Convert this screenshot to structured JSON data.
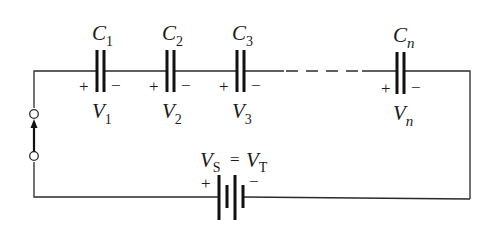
{
  "diagram": {
    "type": "series capacitor circuit",
    "capacitors": [
      {
        "id": "C1",
        "name": "C",
        "sub": "1",
        "volt": "V",
        "vsub": "1",
        "plus": "+",
        "minus": "−"
      },
      {
        "id": "C2",
        "name": "C",
        "sub": "2",
        "volt": "V",
        "vsub": "2",
        "plus": "+",
        "minus": "−"
      },
      {
        "id": "C3",
        "name": "C",
        "sub": "3",
        "volt": "V",
        "vsub": "3",
        "plus": "+",
        "minus": "−"
      },
      {
        "id": "Cn",
        "name": "C",
        "sub": "n",
        "volt": "V",
        "vsub": "n",
        "plus": "+",
        "minus": "−"
      }
    ],
    "source": {
      "label_left": "V",
      "label_left_sub": "S",
      "equals": "=",
      "label_right": "V",
      "label_right_sub": "T",
      "plus": "+",
      "minus": "−"
    },
    "switch": {
      "type": "terminals with arrow"
    },
    "colors": {
      "line": "#2a2a2a",
      "text": "#1a1a1a",
      "background": "#ffffff"
    }
  }
}
